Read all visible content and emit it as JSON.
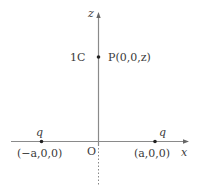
{
  "diagram": {
    "axes": {
      "z_label": "z",
      "x_label": "x",
      "origin_label": "O"
    },
    "point_p": {
      "label": "P(0,0,z)",
      "charge_label": "1C"
    },
    "charges": [
      {
        "charge": "q",
        "coord": "(−a,0,0)"
      },
      {
        "charge": "q",
        "coord": "(a,0,0)"
      }
    ],
    "colors": {
      "axis": "#888888",
      "point": "#222222",
      "text": "#3a3a3a"
    }
  }
}
